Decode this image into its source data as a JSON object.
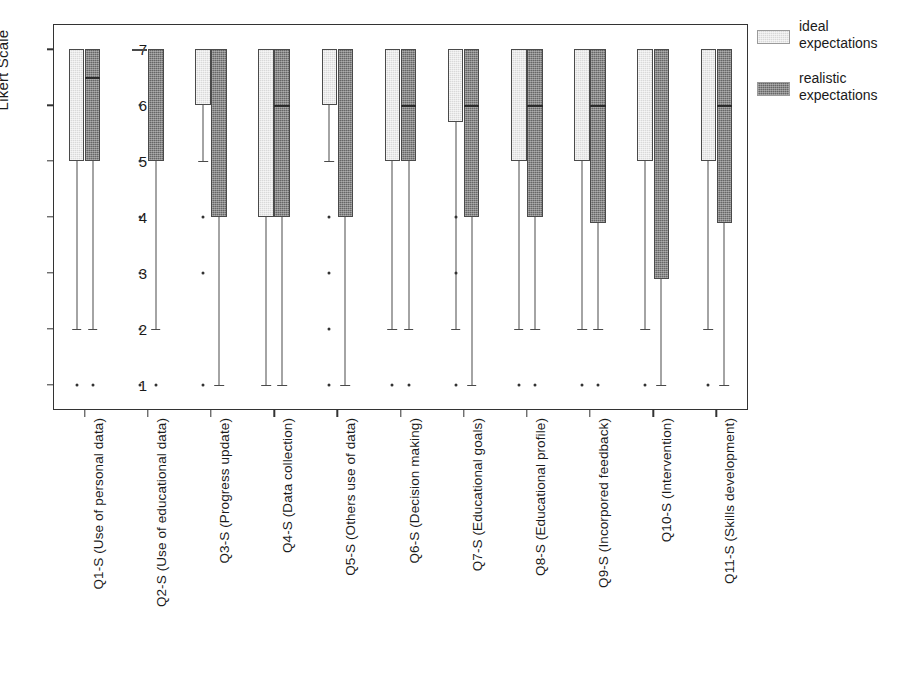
{
  "chart_data": {
    "type": "box",
    "title": "",
    "xlabel": "",
    "ylabel": "Likert Scale",
    "ylim": [
      0.55,
      7.45
    ],
    "yticks": [
      1,
      2,
      3,
      4,
      5,
      6,
      7
    ],
    "ytick_labels": [
      "1",
      "2",
      "3",
      "4",
      "5",
      "6",
      "7"
    ],
    "grid": false,
    "legend_position": "right",
    "categories": [
      "Q1-S (Use of personal data)",
      "Q2-S (Use of educational data)",
      "Q3-S (Progress update)",
      "Q4-S (Data collection)",
      "Q5-S (Others use of data)",
      "Q6-S (Decision making)",
      "Q7-S (Educational goals)",
      "Q8-S (Educational profile)",
      "Q9-S (Incorpored feedback)",
      "Q10-S (Intervention)",
      "Q11-S (Skills development)"
    ],
    "series": [
      {
        "name": "ideal expectations",
        "color": "#d9d9d9",
        "boxes": [
          {
            "q1": 5.0,
            "median": 7.0,
            "q3": 7.0,
            "whisker_low": 2.0,
            "whisker_high": 7.0,
            "outliers": [
              1
            ]
          },
          {
            "q1": 7.0,
            "median": 7.0,
            "q3": 7.0,
            "whisker_low": 7.0,
            "whisker_high": 7.0,
            "outliers": [
              6,
              5,
              4,
              3,
              2,
              1
            ]
          },
          {
            "q1": 6.0,
            "median": 7.0,
            "q3": 7.0,
            "whisker_low": 5.0,
            "whisker_high": 7.0,
            "outliers": [
              4,
              3,
              1
            ]
          },
          {
            "q1": 4.0,
            "median": 7.0,
            "q3": 7.0,
            "whisker_low": 1.0,
            "whisker_high": 7.0,
            "outliers": []
          },
          {
            "q1": 6.0,
            "median": 7.0,
            "q3": 7.0,
            "whisker_low": 5.0,
            "whisker_high": 7.0,
            "outliers": [
              4,
              3,
              2,
              1
            ]
          },
          {
            "q1": 5.0,
            "median": 7.0,
            "q3": 7.0,
            "whisker_low": 2.0,
            "whisker_high": 7.0,
            "outliers": [
              1
            ]
          },
          {
            "q1": 5.7,
            "median": 7.0,
            "q3": 7.0,
            "whisker_low": 2.0,
            "whisker_high": 7.0,
            "outliers": [
              4,
              3,
              1
            ]
          },
          {
            "q1": 5.0,
            "median": 7.0,
            "q3": 7.0,
            "whisker_low": 2.0,
            "whisker_high": 7.0,
            "outliers": [
              1
            ]
          },
          {
            "q1": 5.0,
            "median": 7.0,
            "q3": 7.0,
            "whisker_low": 2.0,
            "whisker_high": 7.0,
            "outliers": [
              1
            ]
          },
          {
            "q1": 5.0,
            "median": 7.0,
            "q3": 7.0,
            "whisker_low": 2.0,
            "whisker_high": 7.0,
            "outliers": [
              1
            ]
          },
          {
            "q1": 5.0,
            "median": 7.0,
            "q3": 7.0,
            "whisker_low": 2.0,
            "whisker_high": 7.0,
            "outliers": [
              1
            ]
          }
        ]
      },
      {
        "name": "realistic expectations",
        "color": "#666666",
        "boxes": [
          {
            "q1": 5.0,
            "median": 6.5,
            "q3": 7.0,
            "whisker_low": 2.0,
            "whisker_high": 7.0,
            "outliers": [
              1
            ]
          },
          {
            "q1": 5.0,
            "median": 7.0,
            "q3": 7.0,
            "whisker_low": 2.0,
            "whisker_high": 7.0,
            "outliers": [
              1
            ]
          },
          {
            "q1": 4.0,
            "median": 7.0,
            "q3": 7.0,
            "whisker_low": 1.0,
            "whisker_high": 7.0,
            "outliers": []
          },
          {
            "q1": 4.0,
            "median": 6.0,
            "q3": 7.0,
            "whisker_low": 1.0,
            "whisker_high": 7.0,
            "outliers": []
          },
          {
            "q1": 4.0,
            "median": 7.0,
            "q3": 7.0,
            "whisker_low": 1.0,
            "whisker_high": 7.0,
            "outliers": []
          },
          {
            "q1": 5.0,
            "median": 6.0,
            "q3": 7.0,
            "whisker_low": 2.0,
            "whisker_high": 7.0,
            "outliers": [
              1
            ]
          },
          {
            "q1": 4.0,
            "median": 6.0,
            "q3": 7.0,
            "whisker_low": 1.0,
            "whisker_high": 7.0,
            "outliers": []
          },
          {
            "q1": 4.0,
            "median": 6.0,
            "q3": 7.0,
            "whisker_low": 2.0,
            "whisker_high": 7.0,
            "outliers": [
              1
            ]
          },
          {
            "q1": 3.9,
            "median": 6.0,
            "q3": 7.0,
            "whisker_low": 2.0,
            "whisker_high": 7.0,
            "outliers": [
              1
            ]
          },
          {
            "q1": 2.9,
            "median": 7.0,
            "q3": 7.0,
            "whisker_low": 1.0,
            "whisker_high": 7.0,
            "outliers": []
          },
          {
            "q1": 3.9,
            "median": 6.0,
            "q3": 7.0,
            "whisker_low": 1.0,
            "whisker_high": 7.0,
            "outliers": []
          }
        ]
      }
    ],
    "legend": [
      {
        "label_line1": "ideal",
        "label_line2": "expectations",
        "swatch": "light"
      },
      {
        "label_line1": "realistic",
        "label_line2": "expectations",
        "swatch": "dark"
      }
    ]
  }
}
